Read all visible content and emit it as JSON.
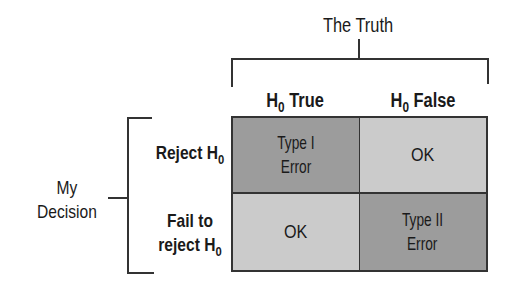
{
  "diagram": {
    "top_label": "The Truth",
    "side_label_line1": "My",
    "side_label_line2": "Decision",
    "columns": [
      {
        "label": "H",
        "subscript": "0",
        "suffix": " True"
      },
      {
        "label": "H",
        "subscript": "0",
        "suffix": " False"
      }
    ],
    "rows": [
      {
        "line1": "Reject H",
        "line1_sub": "0",
        "line2": "",
        "line2_sub": ""
      },
      {
        "line1": "Fail to",
        "line1_sub": "",
        "line2": "reject H",
        "line2_sub": "0"
      }
    ],
    "cells": [
      {
        "line1": "Type I",
        "line2": "Error",
        "shade": "dark"
      },
      {
        "line1": "OK",
        "line2": "",
        "shade": "light"
      },
      {
        "line1": "OK",
        "line2": "",
        "shade": "light"
      },
      {
        "line1": "Type II",
        "line2": "Error",
        "shade": "dark"
      }
    ],
    "colors": {
      "dark_cell": "#9c9c9c",
      "light_cell": "#cbcbcb",
      "lines": "#333333"
    }
  }
}
